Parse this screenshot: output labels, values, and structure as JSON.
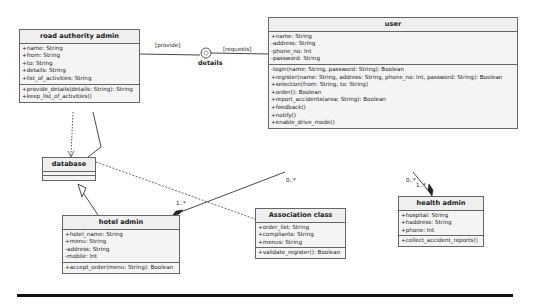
{
  "diagram": {
    "type": "UML class diagram",
    "classes": {
      "road_authority_admin": {
        "name": "road authority admin",
        "attributes": [
          "+name: String",
          "+from: String",
          "+to: String",
          "+details: String",
          "+list_of_activities: String"
        ],
        "operations": [
          "+provide_details(details: String): String",
          "+keep_list_of_activities()"
        ]
      },
      "user": {
        "name": "user",
        "attributes": [
          "+name: String",
          "-address: String",
          "-phone_no: Int",
          "-password: String"
        ],
        "operations": [
          "-login(name: String, password: String): Boolean",
          "+register(name: String, address: String, phone_no: Int, password: String): Boolean",
          "+selection(from: String, to: String)",
          "+order(): Boolean",
          "+report_accidents(area: String): Boolean",
          "+feedback()",
          "+notify()",
          "+enable_drive_mode()"
        ]
      },
      "database": {
        "name": "database",
        "attributes": [],
        "operations": []
      },
      "hotel_admin": {
        "name": "hotel admin",
        "attributes": [
          "+hotel_name: String",
          "+menu: String",
          "-address: String",
          "-mobile: Int"
        ],
        "operations": [
          "+accept_order(menu: String): Boolean"
        ]
      },
      "association_class": {
        "name": "Association class",
        "attributes": [
          "+order_list: String",
          "+compliants: String",
          "+menus: String"
        ],
        "operations": [
          "+validate_register(): Boolean"
        ]
      },
      "health_admin": {
        "name": "health admin",
        "attributes": [
          "+hospital: String",
          "+haddress: String",
          "+phone: Int"
        ],
        "operations": [
          "+collect_accident_reports()"
        ]
      }
    },
    "interface": {
      "name": "details"
    },
    "connector_labels": {
      "provide": "[provide]",
      "requests": "[requests]",
      "user_hotel_mult_user": "0..*",
      "user_hotel_mult_hotel": "1..*",
      "user_health_mult_user": "0..*",
      "user_health_mult_health": "1..*"
    },
    "colors": {
      "box_fill": "#f4f4f4",
      "box_border": "#666666",
      "line": "#333333"
    }
  }
}
